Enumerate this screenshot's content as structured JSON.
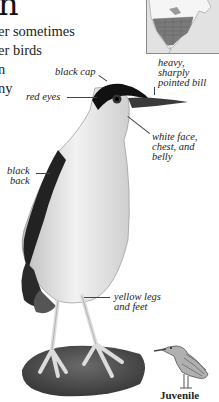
{
  "header": {
    "title_fragment": "n"
  },
  "body": {
    "lines": [
      "er sometimes",
      "er birds",
      "n",
      "ny"
    ]
  },
  "map": {
    "name": "range-map",
    "region": "North America",
    "range_color": "#7a7a7a",
    "land_color": "#f4f4f4",
    "water_color": "#e0e0e0"
  },
  "annotations": {
    "black_cap": "black cap",
    "red_eyes": "red eyes",
    "bill": "heavy,\nsharply\npointed bill",
    "white_face": "white face,\nchest, and\nbelly",
    "black_back": "black\nback",
    "legs": "yellow legs\nand feet"
  },
  "juvenile": {
    "label": "Juvenile"
  }
}
